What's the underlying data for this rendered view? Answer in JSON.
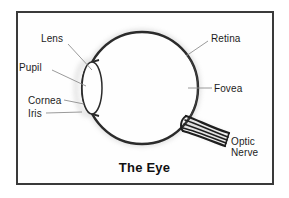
{
  "figure": {
    "title": "The Eye",
    "frame_color": "#3a3a3a",
    "ink_color": "#2b2b2b",
    "background_color": "#ffffff",
    "labels": [
      {
        "id": "lens",
        "text": "Lens"
      },
      {
        "id": "pupil",
        "text": "Pupil"
      },
      {
        "id": "cornea",
        "text": "Cornea"
      },
      {
        "id": "iris",
        "text": "Iris"
      },
      {
        "id": "retina",
        "text": "Retina"
      },
      {
        "id": "fovea",
        "text": "Fovea"
      },
      {
        "id": "optic_nerve_line1",
        "text": "Optic"
      },
      {
        "id": "optic_nerve_line2",
        "text": "Nerve"
      }
    ],
    "parts": [
      {
        "name": "eyeball",
        "shape": "circle"
      },
      {
        "name": "cornea-lens",
        "shape": "ellipse"
      },
      {
        "name": "optic-nerve",
        "shape": "fiber-bundle"
      }
    ]
  }
}
